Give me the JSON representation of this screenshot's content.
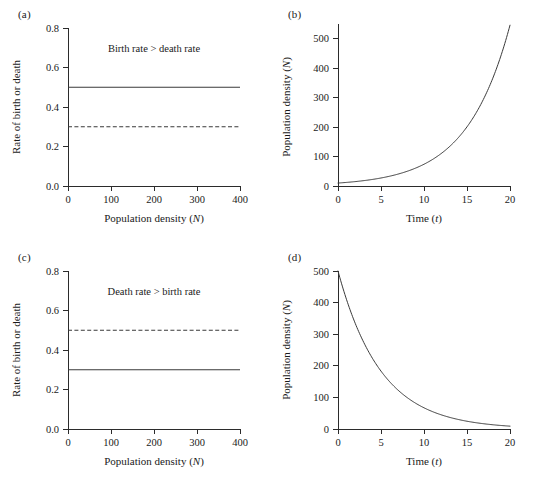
{
  "figure": {
    "background": "#ffffff",
    "ink": "#2b2b2b",
    "panels": [
      "(a)",
      "(b)",
      "(c)",
      "(d)"
    ]
  },
  "panel_a": {
    "label": "(a)",
    "annotation": "Birth rate > death rate"
  },
  "panel_b": {
    "label": "(b)"
  },
  "panel_c": {
    "label": "(c)",
    "annotation": "Death rate > birth rate"
  },
  "panel_d": {
    "label": "(d)"
  },
  "axis_titles": {
    "population_density": "Population density (",
    "population_density_sym": "N",
    "rate_of_birth_or_death": "Rate of birth or death",
    "time": "Time (",
    "time_sym": "t",
    "paren_close": ")"
  },
  "chart_data": [
    {
      "id": "a",
      "type": "line",
      "title": "(a)",
      "xlabel": "Population density (N)",
      "ylabel": "Rate of birth or death",
      "xlim": [
        0,
        400
      ],
      "ylim": [
        0.0,
        0.8
      ],
      "xticks": [
        0,
        100,
        200,
        300,
        400
      ],
      "yticks": [
        "0.0",
        "0.2",
        "0.4",
        "0.6",
        "0.8"
      ],
      "grid": false,
      "legend": "none",
      "annotations": [
        {
          "text": "Birth rate > death rate",
          "x": 250,
          "y": 0.68
        }
      ],
      "series": [
        {
          "name": "Birth rate",
          "style": "solid",
          "constant": 0.5,
          "x": [
            0,
            400
          ],
          "values": [
            0.5,
            0.5
          ]
        },
        {
          "name": "Death rate",
          "style": "dashed",
          "constant": 0.3,
          "x": [
            0,
            400
          ],
          "values": [
            0.3,
            0.3
          ]
        }
      ]
    },
    {
      "id": "b",
      "type": "line",
      "title": "(b)",
      "xlabel": "Time (t)",
      "ylabel": "Population density (N)",
      "xlim": [
        0,
        20
      ],
      "ylim": [
        0,
        550
      ],
      "xticks": [
        0,
        5,
        10,
        15,
        20
      ],
      "yticks": [
        0,
        100,
        200,
        300,
        400,
        500
      ],
      "grid": false,
      "legend": "none",
      "series": [
        {
          "name": "Exponential growth",
          "style": "solid",
          "model": "N = 10 * exp(0.2 * t)",
          "x": [
            0,
            2,
            4,
            6,
            8,
            10,
            12,
            14,
            16,
            18,
            20
          ],
          "values": [
            10,
            15,
            22,
            33,
            50,
            74,
            110,
            164,
            245,
            366,
            546
          ]
        }
      ]
    },
    {
      "id": "c",
      "type": "line",
      "title": "(c)",
      "xlabel": "Population density (N)",
      "ylabel": "Rate of birth or death",
      "xlim": [
        0,
        400
      ],
      "ylim": [
        0.0,
        0.8
      ],
      "xticks": [
        0,
        100,
        200,
        300,
        400
      ],
      "yticks": [
        "0.0",
        "0.2",
        "0.4",
        "0.6",
        "0.8"
      ],
      "grid": false,
      "legend": "none",
      "annotations": [
        {
          "text": "Death rate > birth rate",
          "x": 250,
          "y": 0.68
        }
      ],
      "series": [
        {
          "name": "Death rate",
          "style": "dashed",
          "constant": 0.5,
          "x": [
            0,
            400
          ],
          "values": [
            0.5,
            0.5
          ]
        },
        {
          "name": "Birth rate",
          "style": "solid",
          "constant": 0.3,
          "x": [
            0,
            400
          ],
          "values": [
            0.3,
            0.3
          ]
        }
      ]
    },
    {
      "id": "d",
      "type": "line",
      "title": "(d)",
      "xlabel": "Time (t)",
      "ylabel": "Population density (N)",
      "xlim": [
        0,
        20
      ],
      "ylim": [
        0,
        500
      ],
      "xticks": [
        0,
        5,
        10,
        15,
        20
      ],
      "yticks": [
        0,
        100,
        200,
        300,
        400,
        500
      ],
      "grid": false,
      "legend": "none",
      "series": [
        {
          "name": "Exponential decay",
          "style": "solid",
          "model": "N = 500 * exp(-0.2 * t)",
          "x": [
            0,
            2,
            4,
            6,
            8,
            10,
            12,
            14,
            16,
            18,
            20
          ],
          "values": [
            500,
            335,
            225,
            151,
            101,
            68,
            45,
            30,
            20,
            14,
            9
          ]
        }
      ]
    }
  ]
}
